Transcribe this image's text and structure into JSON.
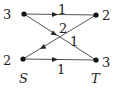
{
  "diagram": {
    "type": "directed-graph",
    "nodes": [
      {
        "id": "top-left",
        "x": 24,
        "y": 14,
        "label": "3"
      },
      {
        "id": "top-right",
        "x": 96,
        "y": 15,
        "label": "2"
      },
      {
        "id": "bottom-left",
        "x": 23,
        "y": 59,
        "label": "2",
        "name": "S"
      },
      {
        "id": "bottom-right",
        "x": 96,
        "y": 60,
        "label": "3",
        "name": "T"
      }
    ],
    "edges": [
      {
        "from": "top-left",
        "to": "top-right",
        "weight": "1"
      },
      {
        "from": "top-left",
        "to": "bottom-right",
        "weight": "1"
      },
      {
        "from": "top-right",
        "to": "bottom-left",
        "weight": "2"
      },
      {
        "from": "bottom-left",
        "to": "bottom-right",
        "weight": "1"
      }
    ],
    "labels": {
      "tl": "3",
      "tr": "2",
      "bl": "2",
      "br": "3",
      "s": "S",
      "t": "T",
      "e_top": "1",
      "e_cross_2": "2",
      "e_cross_1": "1",
      "e_bottom": "1"
    },
    "colors": {
      "line": "#555555",
      "node": "#111111"
    }
  }
}
